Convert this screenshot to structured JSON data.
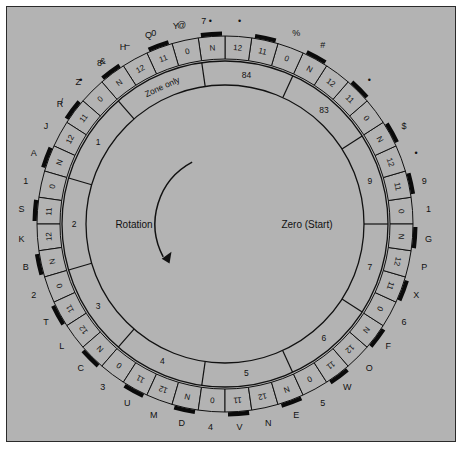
{
  "figure": {
    "kind": "code-wheel-diagram",
    "background_color": "#b3b3b3",
    "ink_color": "#111111",
    "frame_border_color": "#2b2b2b"
  },
  "center_labels": {
    "rotation": "Rotation",
    "zero_start": "Zero (Start)"
  },
  "rotation_arrow": {
    "direction": "clockwise-downward",
    "name": "rotation-arrow"
  },
  "wheel": {
    "cell_count": 44,
    "cell_repeat_unit": [
      "N",
      "0",
      "11",
      "12"
    ],
    "zero_start_angle_deg": 0,
    "cells": [
      {
        "index": 0,
        "value": "0",
        "tick": false,
        "outer": "1"
      },
      {
        "index": 1,
        "value": "11",
        "tick": true,
        "outer": "9"
      },
      {
        "index": 2,
        "value": "12",
        "tick": false,
        "outer": "•"
      },
      {
        "index": 3,
        "value": "N",
        "tick": true,
        "outer": "$"
      },
      {
        "index": 4,
        "value": "0",
        "tick": false,
        "outer": ""
      },
      {
        "index": 5,
        "value": "11",
        "tick": true,
        "outer": "•"
      },
      {
        "index": 6,
        "value": "12",
        "tick": false,
        "outer": ""
      },
      {
        "index": 7,
        "value": "N",
        "tick": true,
        "outer": "#"
      },
      {
        "index": 8,
        "value": "0",
        "tick": false,
        "outer": "%"
      },
      {
        "index": 9,
        "value": "11",
        "tick": true,
        "outer": ""
      },
      {
        "index": 10,
        "value": "12",
        "tick": false,
        "outer": "•"
      },
      {
        "index": 11,
        "value": "N",
        "tick": true,
        "outer": "•"
      },
      {
        "index": 12,
        "value": "0",
        "tick": false,
        "outer": "@"
      },
      {
        "index": 13,
        "value": "11",
        "tick": true,
        "outer": "0"
      },
      {
        "index": 14,
        "value": "12",
        "tick": false,
        "outer": "–"
      },
      {
        "index": 15,
        "value": "N",
        "tick": true,
        "outer": "&"
      },
      {
        "index": 16,
        "value": "0",
        "tick": false,
        "outer": "•"
      },
      {
        "index": 17,
        "value": "11",
        "tick": true,
        "outer": "/"
      },
      {
        "index": 18,
        "value": "12",
        "tick": false,
        "outer": "J"
      },
      {
        "index": 19,
        "value": "N",
        "tick": true,
        "outer": "A"
      },
      {
        "index": 20,
        "value": "0",
        "tick": false,
        "outer": "1"
      },
      {
        "index": 21,
        "value": "11",
        "tick": true,
        "outer": "S"
      },
      {
        "index": 22,
        "value": "12",
        "tick": false,
        "outer": "K"
      },
      {
        "index": 23,
        "value": "N",
        "tick": true,
        "outer": "B"
      },
      {
        "index": 24,
        "value": "0",
        "tick": false,
        "outer": "2"
      },
      {
        "index": 25,
        "value": "11",
        "tick": true,
        "outer": "T"
      },
      {
        "index": 26,
        "value": "12",
        "tick": false,
        "outer": "L"
      },
      {
        "index": 27,
        "value": "N",
        "tick": true,
        "outer": "C"
      },
      {
        "index": 28,
        "value": "0",
        "tick": false,
        "outer": "3"
      },
      {
        "index": 29,
        "value": "11",
        "tick": true,
        "outer": "U"
      },
      {
        "index": 30,
        "value": "12",
        "tick": false,
        "outer": "M"
      },
      {
        "index": 31,
        "value": "N",
        "tick": true,
        "outer": "D"
      },
      {
        "index": 32,
        "value": "0",
        "tick": false,
        "outer": "4"
      },
      {
        "index": 33,
        "value": "11",
        "tick": true,
        "outer": "V"
      },
      {
        "index": 34,
        "value": "12",
        "tick": false,
        "outer": "N"
      },
      {
        "index": 35,
        "value": "N",
        "tick": true,
        "outer": "E"
      },
      {
        "index": 36,
        "value": "0",
        "tick": false,
        "outer": "5"
      },
      {
        "index": 37,
        "value": "11",
        "tick": true,
        "outer": "W"
      },
      {
        "index": 38,
        "value": "12",
        "tick": false,
        "outer": "O"
      },
      {
        "index": 39,
        "value": "N",
        "tick": true,
        "outer": "F"
      },
      {
        "index": 40,
        "value": "0",
        "tick": false,
        "outer": "6"
      },
      {
        "index": 41,
        "value": "11",
        "tick": true,
        "outer": "X"
      },
      {
        "index": 42,
        "value": "12",
        "tick": false,
        "outer": "P"
      },
      {
        "index": 43,
        "value": "N",
        "tick": true,
        "outer": "G"
      }
    ],
    "top_extra_outer_labels": [
      {
        "angle_deg": 96,
        "text": "7"
      },
      {
        "angle_deg": 104,
        "text": "Y"
      },
      {
        "angle_deg": 112,
        "text": "Q"
      },
      {
        "angle_deg": 120,
        "text": "H"
      },
      {
        "angle_deg": 128,
        "text": "8"
      },
      {
        "angle_deg": 136,
        "text": "Z"
      },
      {
        "angle_deg": 144,
        "text": "R"
      }
    ],
    "zones": [
      {
        "label": "9",
        "start_deg": 0,
        "end_deg": 32.7
      },
      {
        "label": "83",
        "start_deg": 32.7,
        "end_deg": 65.4
      },
      {
        "label": "84",
        "start_deg": 65.4,
        "end_deg": 98.2
      },
      {
        "label": "Zone only",
        "start_deg": 98.2,
        "end_deg": 130.9
      },
      {
        "label": "1",
        "start_deg": 130.9,
        "end_deg": 163.6
      },
      {
        "label": "2",
        "start_deg": 163.6,
        "end_deg": 196.4
      },
      {
        "label": "3",
        "start_deg": 196.4,
        "end_deg": 229.1
      },
      {
        "label": "4",
        "start_deg": 229.1,
        "end_deg": 261.8
      },
      {
        "label": "5",
        "start_deg": 261.8,
        "end_deg": 294.5
      },
      {
        "label": "6",
        "start_deg": 294.5,
        "end_deg": 327.3
      },
      {
        "label": "7",
        "start_deg": 327.3,
        "end_deg": 360.0
      }
    ]
  }
}
